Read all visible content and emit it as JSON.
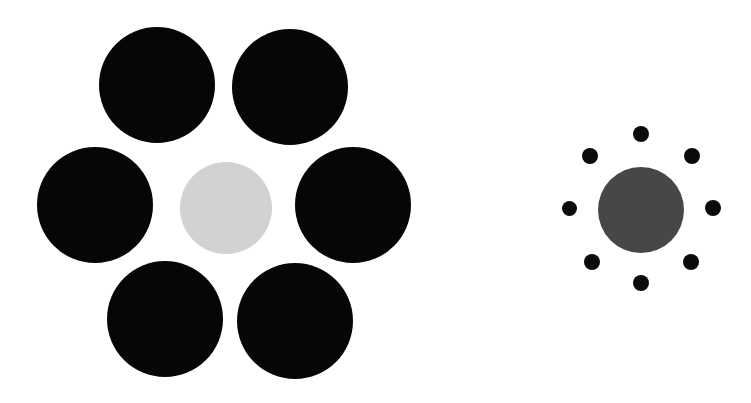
{
  "figure": {
    "name": "Ebbinghaus illusion",
    "alt_name": "Titchener circles",
    "background_color": "#ffffff",
    "width": 751,
    "height": 403
  },
  "colors": {
    "inducer_black": "#060606",
    "inducer_black_small": "#0b0b0b",
    "target_light_gray": "#d2d2d2",
    "target_dark_gray": "#474747",
    "background": "#ffffff"
  },
  "groups": [
    {
      "id": "left-group",
      "label": "Target surrounded by large inducers",
      "target": {
        "id": "left-target",
        "label": "Left target circle",
        "cx": 226,
        "cy": 208,
        "d": 92,
        "color": "#d2d2d2",
        "kind": "target-light"
      },
      "inducers": [
        {
          "id": "left-inducer-top-left",
          "label": "Top left inducer",
          "cx": 157,
          "cy": 85,
          "d": 116,
          "color": "#060606"
        },
        {
          "id": "left-inducer-top-right",
          "label": "Top right inducer",
          "cx": 290,
          "cy": 87,
          "d": 116,
          "color": "#060606"
        },
        {
          "id": "left-inducer-middle-left",
          "label": "Middle left inducer",
          "cx": 95,
          "cy": 205,
          "d": 116,
          "color": "#060606"
        },
        {
          "id": "left-inducer-middle-right",
          "label": "Middle right inducer",
          "cx": 353,
          "cy": 205,
          "d": 116,
          "color": "#060606"
        },
        {
          "id": "left-inducer-bottom-left",
          "label": "Bottom left inducer",
          "cx": 165,
          "cy": 319,
          "d": 116,
          "color": "#060606"
        },
        {
          "id": "left-inducer-bottom-right",
          "label": "Bottom right inducer",
          "cx": 295,
          "cy": 321,
          "d": 116,
          "color": "#060606"
        }
      ]
    },
    {
      "id": "right-group",
      "label": "Target surrounded by small inducers",
      "target": {
        "id": "right-target",
        "label": "Right target circle",
        "cx": 641,
        "cy": 210,
        "d": 86,
        "color": "#474747",
        "kind": "target-dark"
      },
      "inducers": [
        {
          "id": "right-inducer-n",
          "label": "North inducer dot",
          "cx": 641,
          "cy": 134,
          "d": 16,
          "color": "#0b0b0b"
        },
        {
          "id": "right-inducer-ne",
          "label": "North east inducer dot",
          "cx": 692,
          "cy": 156,
          "d": 16,
          "color": "#0b0b0b"
        },
        {
          "id": "right-inducer-e",
          "label": "East inducer dot",
          "cx": 713,
          "cy": 208,
          "d": 16,
          "color": "#0b0b0b"
        },
        {
          "id": "right-inducer-se",
          "label": "South east inducer dot",
          "cx": 691,
          "cy": 262,
          "d": 16,
          "color": "#0b0b0b"
        },
        {
          "id": "right-inducer-s",
          "label": "South inducer dot",
          "cx": 641,
          "cy": 283,
          "d": 16,
          "color": "#0b0b0b"
        },
        {
          "id": "right-inducer-sw",
          "label": "South west inducer dot",
          "cx": 592,
          "cy": 262,
          "d": 16,
          "color": "#0b0b0b"
        },
        {
          "id": "right-inducer-w",
          "label": "West inducer dot",
          "cx": 569,
          "cy": 208,
          "d": 15,
          "color": "#0b0b0b"
        },
        {
          "id": "right-inducer-nw",
          "label": "North west inducer dot",
          "cx": 590,
          "cy": 156,
          "d": 16,
          "color": "#0b0b0b"
        }
      ]
    }
  ]
}
